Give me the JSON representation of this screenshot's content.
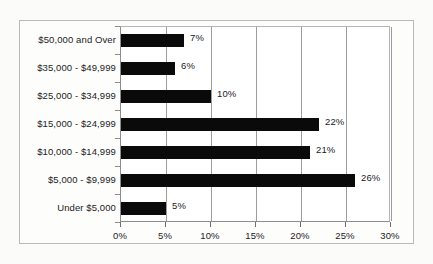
{
  "chart_data": {
    "type": "bar",
    "orientation": "horizontal",
    "title": "",
    "xlabel": "",
    "ylabel": "",
    "xlim": [
      0,
      30
    ],
    "xtick_labels": [
      "0%",
      "5%",
      "10%",
      "15%",
      "20%",
      "25%",
      "30%"
    ],
    "xtick_values": [
      0,
      5,
      10,
      15,
      20,
      25,
      30
    ],
    "grid": true,
    "legend": false,
    "categories": [
      "$50,000 and Over",
      "$35,000 - $49,999",
      "$25,000 - $34,999",
      "$15,000 - $24,999",
      "$10,000 - $14,999",
      "$5,000 - $9,999",
      "Under $5,000"
    ],
    "values": [
      7,
      6,
      10,
      22,
      21,
      26,
      5
    ],
    "data_labels": [
      "7%",
      "6%",
      "10%",
      "22%",
      "21%",
      "26%",
      "5%"
    ],
    "colors": {
      "bar": "#0a0a0a",
      "gridline": "#9d9d9d",
      "axis": "#8d8d8d",
      "frame": "#b9b9b9",
      "text": "#1c1c1c",
      "plot_background": "#ffffff",
      "figure_background": "#fbfbfa"
    }
  }
}
